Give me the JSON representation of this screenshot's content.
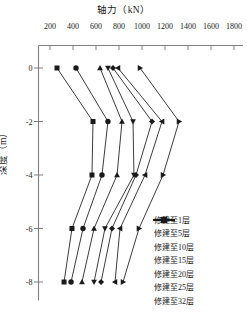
{
  "chart_data": {
    "type": "line",
    "title": "轴力（kN）",
    "xlabel": "轴力（kN）",
    "ylabel": "深度（m）",
    "orientation": "x-axis-on-top, depth-negative-downward",
    "xlim": [
      200,
      1800
    ],
    "ylim": [
      -8.6,
      0.6
    ],
    "xticks": [
      200,
      400,
      600,
      800,
      1000,
      1200,
      1400,
      1600,
      1800
    ],
    "yticks": [
      0,
      -2,
      -4,
      -6,
      -8
    ],
    "xtick_labels": [
      "200",
      "400",
      "600",
      "800",
      "1000",
      "1200",
      "1400",
      "1600",
      "1800"
    ],
    "ytick_labels": [
      "0",
      "-2",
      "-4",
      "-6",
      "-8"
    ],
    "grid": false,
    "legend_position": "lower-right",
    "depths": [
      0,
      -2,
      -4,
      -6,
      -8
    ],
    "series": [
      {
        "name": "修建至1层",
        "marker": "square",
        "values": [
          261,
          574,
          565,
          391,
          322
        ]
      },
      {
        "name": "修建至5层",
        "marker": "circle",
        "values": [
          426,
          704,
          652,
          487,
          383
        ]
      },
      {
        "name": "修建至10层",
        "marker": "triangle-up",
        "values": [
          635,
          826,
          783,
          583,
          478
        ]
      },
      {
        "name": "修建至15层",
        "marker": "triangle-down",
        "values": [
          704,
          922,
          930,
          678,
          583
        ]
      },
      {
        "name": "修建至20层",
        "marker": "diamond",
        "values": [
          748,
          1087,
          948,
          739,
          644
        ]
      },
      {
        "name": "修建至25层",
        "marker": "triangle-left",
        "values": [
          791,
          1174,
          1026,
          809,
          765
        ]
      },
      {
        "name": "修建至32层",
        "marker": "triangle-right",
        "values": [
          983,
          1322,
          1183,
          974,
          835
        ]
      }
    ]
  },
  "axis": {
    "top_title": "轴力（kN）",
    "left_title": "深度（m）"
  },
  "colors": {
    "axis": "#808080",
    "series": "#1a1a1a",
    "background": "#ffffff"
  }
}
